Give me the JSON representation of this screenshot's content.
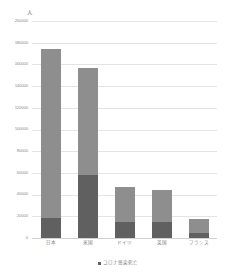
{
  "chart_data": {
    "type": "bar",
    "title": "",
    "subtitle": "",
    "xlabel": "",
    "ylabel": "",
    "unit_label": "人",
    "ylim": [
      0,
      200000
    ],
    "ytick_step": 20000,
    "grid": true,
    "stacked": true,
    "legend_position": "bottom",
    "categories": [
      "日本",
      "米国",
      "ドイツ",
      "英国",
      "フランス"
    ],
    "series": [
      {
        "name": "コロナ感染死亡",
        "color": "#606060",
        "values": [
          18000,
          58000,
          15000,
          15000,
          5000
        ]
      },
      {
        "name": "",
        "color": "#8e8e8e",
        "values": [
          156000,
          99000,
          32000,
          29000,
          12500
        ]
      }
    ],
    "totals": [
      174000,
      157000,
      47000,
      44000,
      17500
    ],
    "ytick_labels": [
      "200000",
      "180000",
      "160000",
      "140000",
      "120000",
      "100000",
      "80000",
      "60000",
      "40000",
      "20000",
      "0"
    ],
    "ytick_values": [
      200000,
      180000,
      160000,
      140000,
      120000,
      100000,
      80000,
      60000,
      40000,
      20000,
      0
    ],
    "legend": [
      {
        "label": "コロナ感染死亡",
        "color": "#606060"
      }
    ]
  }
}
